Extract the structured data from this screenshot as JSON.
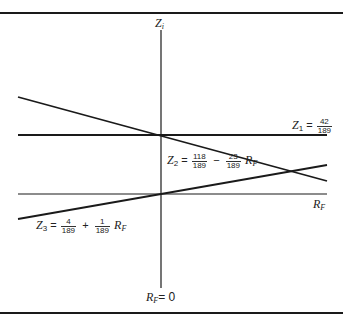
{
  "diagram": {
    "vertical_axis_label": {
      "var": "Z",
      "sub": "i"
    },
    "horizontal_axis_label": {
      "var": "R",
      "sub": "F"
    },
    "origin_label": {
      "var": "R",
      "sub": "F",
      "eq": "= 0"
    },
    "lines": [
      {
        "name": "Z1",
        "label": {
          "var": "Z",
          "sub": "1",
          "eq": "=",
          "num": "42",
          "den": "189"
        },
        "equation": "Z1 = 42/189"
      },
      {
        "name": "Z2",
        "label": {
          "var": "Z",
          "sub": "2",
          "eq": "=",
          "num1": "118",
          "den1": "189",
          "op": "−",
          "num2": "23",
          "den2": "189",
          "rvar": "R",
          "rsub": "F"
        },
        "equation": "Z2 = 118/189 − 23/189 R_F"
      },
      {
        "name": "Z3",
        "label": {
          "var": "Z",
          "sub": "3",
          "eq": "=",
          "num1": "4",
          "den1": "189",
          "op": "+",
          "num2": "1",
          "den2": "189",
          "rvar": "R",
          "rsub": "F"
        },
        "equation": "Z3 = 4/189 + 1/189 R_F"
      }
    ],
    "colors": {
      "line": "#1a1a1a",
      "border": "#1a1a1a",
      "background": "#ffffff"
    }
  }
}
